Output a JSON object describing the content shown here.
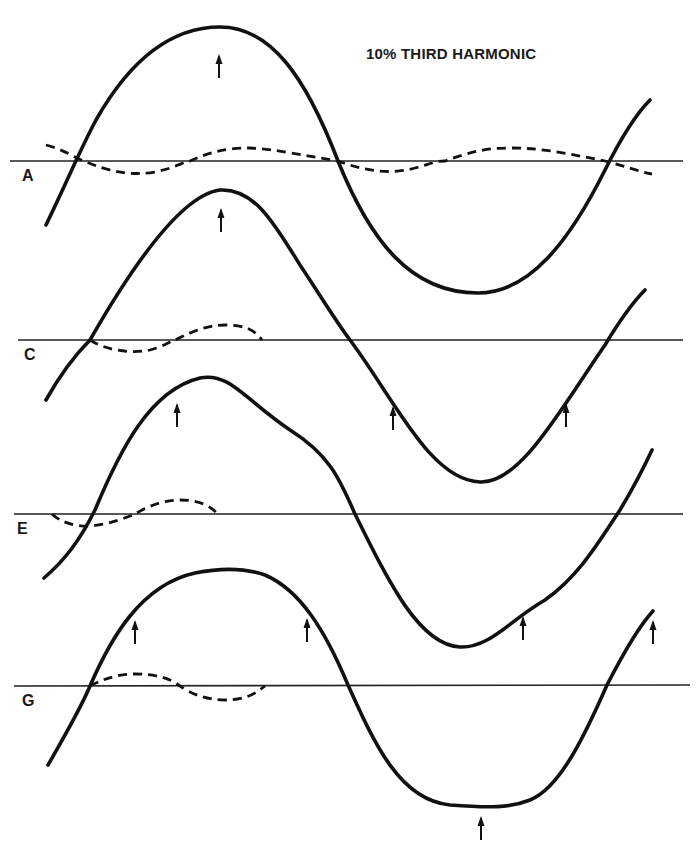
{
  "title": "10% THIRD HARMONIC",
  "panels": [
    {
      "label": "A",
      "axis_y": 161,
      "label_pos": [
        22,
        167
      ]
    },
    {
      "label": "C",
      "axis_y": 340,
      "label_pos": [
        24,
        346
      ]
    },
    {
      "label": "E",
      "axis_y": 514,
      "label_pos": [
        17,
        520
      ]
    },
    {
      "label": "G",
      "axis_y": 687,
      "label_pos": [
        22,
        692
      ]
    }
  ],
  "legend": {
    "solid_line": "resultant waveform",
    "dashed_line": "third harmonic component"
  },
  "colors": {
    "ink": "#111111",
    "background": "#ffffff"
  }
}
